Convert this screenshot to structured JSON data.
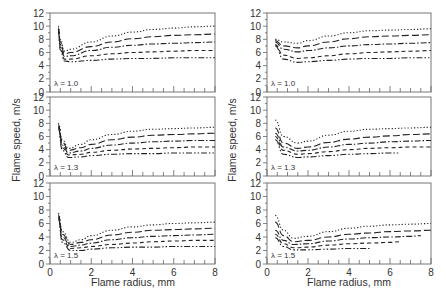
{
  "chart_data": [
    {
      "type": "line",
      "panel": "left-top",
      "annotation": "λ = 1.0",
      "xlim": [
        0,
        8
      ],
      "ylim": [
        0,
        12
      ],
      "xticks": [
        0,
        2,
        4,
        6,
        8
      ],
      "yticks": [
        0,
        2,
        4,
        6,
        8,
        10,
        12
      ],
      "series": [
        {
          "name": "curve-1",
          "style": "dotted",
          "x": [
            0.4,
            0.5,
            0.7,
            1,
            2,
            3,
            4,
            5,
            6,
            7,
            8
          ],
          "y": [
            10,
            8,
            6.2,
            6.5,
            7.6,
            8.5,
            9.1,
            9.5,
            9.7,
            9.9,
            10.0
          ]
        },
        {
          "name": "curve-2",
          "style": "long-dash",
          "x": [
            0.4,
            0.5,
            0.7,
            1,
            2,
            3,
            4,
            5,
            6,
            7,
            8
          ],
          "y": [
            9.8,
            7.6,
            5.8,
            6.0,
            6.9,
            7.6,
            8.1,
            8.4,
            8.6,
            8.7,
            8.8
          ]
        },
        {
          "name": "curve-3",
          "style": "dash-dot",
          "x": [
            0.4,
            0.5,
            0.7,
            1,
            2,
            3,
            4,
            5,
            6,
            7,
            8
          ],
          "y": [
            9.6,
            7.2,
            5.4,
            5.5,
            6.3,
            6.8,
            7.1,
            7.3,
            7.4,
            7.5,
            7.6
          ]
        },
        {
          "name": "curve-4",
          "style": "dashed",
          "x": [
            0.4,
            0.5,
            0.7,
            1,
            2,
            3,
            4,
            5,
            6,
            7,
            8
          ],
          "y": [
            9.4,
            6.8,
            5.0,
            5.0,
            5.5,
            5.8,
            6.0,
            6.1,
            6.2,
            6.3,
            6.3
          ]
        },
        {
          "name": "curve-5",
          "style": "dash-dot-dot",
          "x": [
            0.4,
            0.5,
            0.7,
            1,
            2,
            3,
            4,
            5,
            6,
            7,
            8
          ],
          "y": [
            9.2,
            6.4,
            4.7,
            4.6,
            4.8,
            5.0,
            5.1,
            5.1,
            5.2,
            5.2,
            5.2
          ]
        }
      ]
    },
    {
      "type": "line",
      "panel": "left-middle",
      "annotation": "λ = 1.3",
      "xlim": [
        0,
        8
      ],
      "ylim": [
        0,
        12
      ],
      "xticks": [
        0,
        2,
        4,
        6,
        8
      ],
      "yticks": [
        0,
        2,
        4,
        6,
        8,
        10,
        12
      ],
      "series": [
        {
          "name": "curve-1",
          "style": "dotted",
          "x": [
            0.4,
            0.6,
            0.9,
            1.5,
            2,
            3,
            4,
            5,
            6,
            7,
            8
          ],
          "y": [
            8,
            5.5,
            4.2,
            4.8,
            5.5,
            6.3,
            6.8,
            7.1,
            7.2,
            7.3,
            7.4
          ]
        },
        {
          "name": "curve-2",
          "style": "long-dash",
          "x": [
            0.4,
            0.6,
            0.9,
            1.5,
            2,
            3,
            4,
            5,
            6,
            7,
            8
          ],
          "y": [
            7.8,
            5.1,
            3.9,
            4.3,
            4.8,
            5.5,
            5.9,
            6.2,
            6.3,
            6.4,
            6.5
          ]
        },
        {
          "name": "curve-3",
          "style": "dash-dot",
          "x": [
            0.4,
            0.6,
            0.9,
            1.5,
            2,
            3,
            4,
            5,
            6,
            7,
            8
          ],
          "y": [
            7.6,
            4.7,
            3.5,
            3.8,
            4.2,
            4.7,
            5.0,
            5.2,
            5.3,
            5.4,
            5.4
          ]
        },
        {
          "name": "curve-4",
          "style": "dashed",
          "x": [
            0.4,
            0.6,
            0.9,
            1.5,
            2,
            3,
            4,
            5,
            6,
            7,
            8
          ],
          "y": [
            7.4,
            4.3,
            3.2,
            3.3,
            3.6,
            3.9,
            4.1,
            4.2,
            4.3,
            4.4,
            4.4
          ]
        },
        {
          "name": "curve-5",
          "style": "dash-dot-dot",
          "x": [
            0.4,
            0.6,
            0.9,
            1.5,
            2,
            3,
            4,
            5,
            6,
            7,
            8
          ],
          "y": [
            7.2,
            3.9,
            2.8,
            2.9,
            3.1,
            3.3,
            3.4,
            3.4,
            3.5,
            3.5,
            3.5
          ]
        }
      ]
    },
    {
      "type": "line",
      "panel": "left-bottom",
      "annotation": "λ = 1.5",
      "xlim": [
        0,
        8
      ],
      "ylim": [
        0,
        12
      ],
      "xticks": [
        0,
        2,
        4,
        6,
        8
      ],
      "yticks": [
        0,
        2,
        4,
        6,
        8,
        10,
        12
      ],
      "series": [
        {
          "name": "curve-1",
          "style": "dotted",
          "x": [
            0.4,
            0.6,
            1,
            1.5,
            2,
            3,
            4,
            5,
            6,
            7,
            8
          ],
          "y": [
            7.5,
            4.8,
            3.2,
            3.6,
            4.2,
            5.0,
            5.5,
            5.8,
            6.0,
            6.1,
            6.2
          ]
        },
        {
          "name": "curve-2",
          "style": "long-dash",
          "x": [
            0.4,
            0.6,
            1,
            1.5,
            2,
            3,
            4,
            5,
            6,
            7,
            8
          ],
          "y": [
            7.3,
            4.4,
            2.9,
            3.2,
            3.6,
            4.3,
            4.7,
            5.0,
            5.1,
            5.2,
            5.3
          ]
        },
        {
          "name": "curve-3",
          "style": "dash-dot",
          "x": [
            0.4,
            0.6,
            1,
            1.5,
            2,
            3,
            4,
            5,
            6,
            7,
            8
          ],
          "y": [
            7.1,
            4.0,
            2.6,
            2.8,
            3.1,
            3.6,
            3.9,
            4.1,
            4.2,
            4.3,
            4.4
          ]
        },
        {
          "name": "curve-4",
          "style": "dashed",
          "x": [
            0.4,
            0.6,
            1,
            1.5,
            2,
            3,
            4,
            5,
            6,
            7,
            8
          ],
          "y": [
            6.9,
            3.6,
            2.3,
            2.4,
            2.6,
            2.9,
            3.1,
            3.3,
            3.4,
            3.5,
            3.5
          ]
        },
        {
          "name": "curve-5",
          "style": "dash-dot-dot",
          "x": [
            0.4,
            0.6,
            1,
            1.5,
            2,
            3,
            4,
            5,
            6,
            7,
            8
          ],
          "y": [
            6.7,
            3.2,
            2.0,
            2.0,
            2.2,
            2.4,
            2.5,
            2.5,
            2.6,
            2.6,
            2.6
          ]
        }
      ]
    },
    {
      "type": "line",
      "panel": "right-top",
      "annotation": "λ = 1.0",
      "xlim": [
        0,
        8
      ],
      "ylim": [
        0,
        12
      ],
      "xticks": [
        0,
        2,
        4,
        6,
        8
      ],
      "yticks": [
        0,
        2,
        4,
        6,
        8,
        10,
        12
      ],
      "series": [
        {
          "name": "curve-1",
          "style": "dotted",
          "x": [
            0.4,
            0.8,
            1.5,
            2,
            3,
            4,
            5,
            6,
            7,
            8
          ],
          "y": [
            8.0,
            7.6,
            7.4,
            7.8,
            8.5,
            9.0,
            9.3,
            9.4,
            9.5,
            9.6
          ]
        },
        {
          "name": "curve-2",
          "style": "long-dash",
          "x": [
            0.4,
            0.8,
            1.5,
            2,
            3,
            4,
            5,
            6,
            7,
            8
          ],
          "y": [
            7.8,
            7.0,
            6.7,
            7.0,
            7.6,
            8.1,
            8.4,
            8.5,
            8.6,
            8.7
          ]
        },
        {
          "name": "curve-3",
          "style": "dash-dot",
          "x": [
            0.4,
            0.8,
            1.5,
            2,
            3,
            4,
            5,
            6,
            7,
            8
          ],
          "y": [
            7.6,
            6.5,
            6.1,
            6.3,
            6.7,
            7.0,
            7.2,
            7.3,
            7.4,
            7.5
          ]
        },
        {
          "name": "curve-4",
          "style": "dashed",
          "x": [
            0.4,
            0.8,
            1.5,
            2,
            3,
            4,
            5,
            6,
            7,
            8
          ],
          "y": [
            7.2,
            5.6,
            5.1,
            5.2,
            5.5,
            5.8,
            6.0,
            6.1,
            6.2,
            6.3
          ]
        },
        {
          "name": "curve-5",
          "style": "dash-dot-dot",
          "x": [
            0.4,
            0.8,
            1.5,
            2,
            3,
            4,
            5,
            6,
            7,
            8
          ],
          "y": [
            7.0,
            5.0,
            4.5,
            4.6,
            4.8,
            5.0,
            5.1,
            5.1,
            5.2,
            5.2
          ]
        }
      ]
    },
    {
      "type": "line",
      "panel": "right-middle",
      "annotation": "λ = 1.3",
      "xlim": [
        0,
        8
      ],
      "ylim": [
        0,
        12
      ],
      "xticks": [
        0,
        2,
        4,
        6,
        8
      ],
      "yticks": [
        0,
        2,
        4,
        6,
        8,
        10,
        12
      ],
      "series": [
        {
          "name": "curve-1",
          "style": "dotted",
          "x": [
            0.4,
            0.8,
            1.5,
            2,
            3,
            4,
            5,
            6,
            7,
            8
          ],
          "y": [
            8.5,
            6.0,
            5.0,
            5.3,
            6.2,
            6.8,
            7.1,
            7.2,
            7.3,
            7.4
          ]
        },
        {
          "name": "curve-2",
          "style": "long-dash",
          "x": [
            0.4,
            0.8,
            1.5,
            2,
            3,
            4,
            5,
            6,
            7,
            8
          ],
          "y": [
            7.3,
            5.0,
            4.2,
            4.4,
            5.1,
            5.6,
            5.9,
            6.1,
            6.3,
            6.4
          ]
        },
        {
          "name": "curve-3",
          "style": "dash-dot",
          "x": [
            0.4,
            0.8,
            1.5,
            2,
            3,
            4,
            5,
            6,
            7,
            8
          ],
          "y": [
            6.5,
            4.4,
            3.8,
            3.9,
            4.4,
            4.8,
            5.0,
            5.2,
            5.3,
            5.4
          ]
        },
        {
          "name": "curve-4",
          "style": "dashed",
          "x": [
            0.4,
            0.8,
            1.5,
            2,
            3,
            4,
            5,
            6,
            7,
            8
          ],
          "y": [
            6.0,
            3.9,
            3.3,
            3.4,
            3.7,
            4.0,
            4.2,
            4.3,
            4.4,
            4.4
          ]
        },
        {
          "name": "curve-5",
          "style": "dash-dot-dot",
          "x": [
            0.4,
            0.8,
            1.5,
            2,
            3,
            4,
            5,
            6,
            6.5
          ],
          "y": [
            5.5,
            3.3,
            2.8,
            2.9,
            3.1,
            3.3,
            3.4,
            3.5,
            3.5
          ]
        }
      ]
    },
    {
      "type": "line",
      "panel": "right-bottom",
      "annotation": "λ = 1.5",
      "xlim": [
        0,
        8
      ],
      "ylim": [
        0,
        12
      ],
      "xticks": [
        0,
        2,
        4,
        6,
        8
      ],
      "yticks": [
        0,
        2,
        4,
        6,
        8,
        10,
        12
      ],
      "series": [
        {
          "name": "curve-1",
          "style": "dotted",
          "x": [
            0.4,
            0.8,
            1.3,
            2,
            3,
            4,
            5,
            6,
            7,
            8
          ],
          "y": [
            7.2,
            5.0,
            3.8,
            4.1,
            4.8,
            5.3,
            5.6,
            5.8,
            5.9,
            6.0
          ]
        },
        {
          "name": "curve-2",
          "style": "long-dash",
          "x": [
            0.4,
            0.8,
            1.3,
            2,
            3,
            4,
            5,
            6,
            7,
            8
          ],
          "y": [
            6.2,
            4.2,
            3.3,
            3.5,
            4.0,
            4.4,
            4.6,
            4.8,
            4.9,
            5.0
          ]
        },
        {
          "name": "curve-3",
          "style": "dash-dot",
          "x": [
            0.4,
            0.8,
            1.3,
            2,
            3,
            4,
            5,
            6,
            7,
            7.5
          ],
          "y": [
            5.0,
            3.5,
            2.9,
            3.0,
            3.4,
            3.7,
            3.9,
            4.0,
            4.1,
            4.2
          ]
        },
        {
          "name": "curve-4",
          "style": "dashed",
          "x": [
            0.4,
            0.8,
            1.3,
            2,
            3,
            4,
            5,
            6,
            6.5
          ],
          "y": [
            4.4,
            3.0,
            2.4,
            2.5,
            2.8,
            3.0,
            3.1,
            3.2,
            3.3
          ]
        },
        {
          "name": "curve-5",
          "style": "dash-dot-dot",
          "x": [
            0.4,
            0.8,
            1.3,
            2,
            3,
            4,
            5
          ],
          "y": [
            3.9,
            2.6,
            2.1,
            2.1,
            2.2,
            2.3,
            2.3
          ]
        }
      ]
    }
  ],
  "labels": {
    "ylabel_left": "Flame speed, m/s",
    "ylabel_right": "Flame speed, m/s",
    "xlabel_left": "Flame radius, mm",
    "xlabel_right": "Flame radius, mm"
  }
}
